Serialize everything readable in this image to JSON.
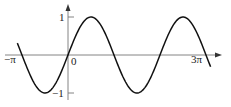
{
  "chart_data": {
    "type": "line",
    "title": "",
    "function": "y = sin(x)",
    "xlabel": "",
    "ylabel": "",
    "x_tick_labels": [
      "−π",
      "0",
      "3π"
    ],
    "x_tick_values": [
      -3.14159,
      0,
      9.42478
    ],
    "y_tick_labels": [
      "1",
      "−1"
    ],
    "y_tick_values": [
      1,
      -1
    ],
    "xlim": [
      -3.5,
      9.8
    ],
    "ylim": [
      -1.15,
      1.15
    ],
    "grid": false,
    "legend": null,
    "series": [
      {
        "name": "sin(x)",
        "x": [
          -3.46,
          -3.14159,
          -2.356,
          -1.5708,
          -0.785,
          0,
          0.785,
          1.5708,
          2.356,
          3.14159,
          3.927,
          4.712,
          5.498,
          6.2832,
          7.069,
          7.854,
          8.639,
          9.4248,
          9.74
        ],
        "values": [
          0.31,
          0,
          -0.707,
          -1,
          -0.707,
          0,
          0.707,
          1,
          0.707,
          0,
          -0.707,
          -1,
          -0.707,
          0,
          0.707,
          1,
          0.707,
          0,
          -0.31
        ]
      }
    ],
    "colors": {
      "curve": "#111111",
      "axes": "#777777"
    }
  },
  "axes": {
    "x_labels": {
      "neg_pi": "−π",
      "zero": "0",
      "three_pi": "3π"
    },
    "y_labels": {
      "one": "1",
      "neg_one": "−1"
    }
  },
  "layout": {
    "origin_px": [
      68,
      55
    ],
    "px_per_pi": 46,
    "amp_px": 38,
    "x_start": -3.46,
    "x_end": 9.74
  }
}
